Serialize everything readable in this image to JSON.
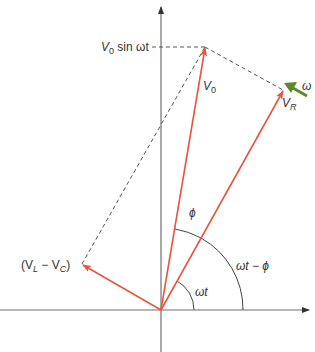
{
  "diagram": {
    "type": "phasor-diagram",
    "colors": {
      "axis": "#707070",
      "phasor": "#e8553e",
      "dashed": "#555555",
      "omega_arrow": "#5a8a2a",
      "arc": "#444444",
      "text": "#333333"
    },
    "labels": {
      "v0_sin": {
        "main": "V",
        "sub": "0",
        "rest": " sin ωt"
      },
      "v0": {
        "main": "V",
        "sub": "0"
      },
      "vr": {
        "main": "V",
        "sub": "R"
      },
      "omega": "ω",
      "vl_vc": {
        "open": "(V",
        "sub1": "L",
        "mid": " − V",
        "sub2": "C",
        "close": ")"
      },
      "phi": "ϕ",
      "omega_t_minus_phi": "ωt − ϕ",
      "omega_t": "ωt"
    },
    "phasors": [
      {
        "name": "V0",
        "from": [
          161,
          310
        ],
        "to": [
          205,
          47
        ]
      },
      {
        "name": "VR",
        "from": [
          161,
          310
        ],
        "to": [
          283,
          90
        ]
      },
      {
        "name": "VL-VC",
        "from": [
          161,
          310
        ],
        "to": [
          82,
          264
        ]
      }
    ]
  }
}
